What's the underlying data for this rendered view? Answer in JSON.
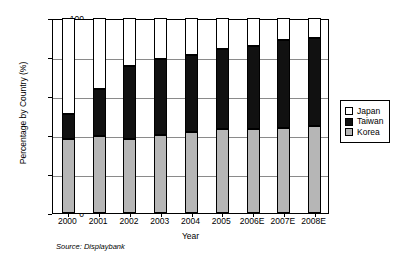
{
  "chart_data": {
    "type": "bar",
    "title": "",
    "xlabel": "Year",
    "ylabel": "Percentage by Country (%)",
    "ylim": [
      0,
      100
    ],
    "yticks": [
      0,
      20,
      40,
      60,
      80,
      100
    ],
    "ytick_labels": [
      "0",
      "20",
      "40",
      "60",
      "80",
      "100"
    ],
    "grid": true,
    "stacked": true,
    "legend_position": "right",
    "categories": [
      "2000",
      "2001",
      "2002",
      "2003",
      "2004",
      "2005",
      "2006E",
      "2007E",
      "2008E"
    ],
    "series": [
      {
        "name": "Korea",
        "color": "#b6b6b6",
        "values": [
          38,
          39.5,
          38,
          40,
          41.5,
          43,
          43,
          43.5,
          44.5
        ]
      },
      {
        "name": "Taiwan",
        "color": "#111111",
        "values": [
          13,
          24,
          37.5,
          39,
          39.5,
          41,
          42.5,
          45,
          45.5
        ]
      },
      {
        "name": "Japan",
        "color": "#ffffff",
        "values": [
          49,
          36.5,
          24.5,
          21,
          19,
          16,
          14.5,
          11.5,
          10
        ]
      }
    ],
    "cumulative_tops": {
      "korea": [
        38,
        39.5,
        38,
        40,
        41.5,
        43,
        43,
        43.5,
        44.5
      ],
      "korea_plus_taiwan": [
        51,
        63.5,
        75.5,
        79,
        81,
        84,
        85.5,
        88.5,
        90
      ],
      "total": [
        100,
        100,
        100,
        100,
        100,
        100,
        100,
        100,
        100
      ]
    },
    "annotations": {
      "source": "Source: Displaybank"
    }
  },
  "legend": {
    "items": [
      {
        "label": "Japan",
        "color": "#ffffff"
      },
      {
        "label": "Taiwan",
        "color": "#111111"
      },
      {
        "label": "Korea",
        "color": "#b6b6b6"
      }
    ]
  }
}
